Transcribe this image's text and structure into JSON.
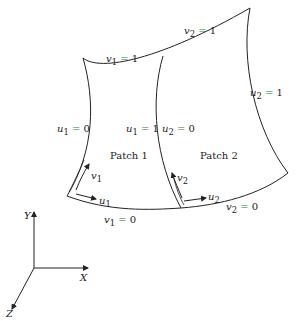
{
  "diagram": {
    "type": "two bicubic surface patches joined along a common edge",
    "patches": [
      {
        "name": "Patch 1",
        "label": "Patch 1"
      },
      {
        "name": "Patch 2",
        "label": "Patch 2"
      }
    ],
    "edge_labels": {
      "v1_top": {
        "var": "v",
        "sub": "1",
        "eq": "=",
        "val": "1"
      },
      "v2_top": {
        "var": "v",
        "sub": "2",
        "eq": "=",
        "val": "1"
      },
      "u1_left": {
        "var": "u",
        "sub": "1",
        "eq": "=",
        "val": "0"
      },
      "u1_right": {
        "var": "u",
        "sub": "1",
        "eq": "=",
        "val": "1"
      },
      "u2_left": {
        "var": "u",
        "sub": "2",
        "eq": "=",
        "val": "0"
      },
      "u2_right": {
        "var": "u",
        "sub": "2",
        "eq": "=",
        "val": "1"
      },
      "v1_bottom": {
        "var": "v",
        "sub": "1",
        "eq": "=",
        "val": "0"
      },
      "v2_bottom": {
        "var": "v",
        "sub": "2",
        "eq": "=",
        "val": "0"
      }
    },
    "direction_arrows": {
      "patch1_u": {
        "var": "u",
        "sub": "1"
      },
      "patch1_v": {
        "var": "v",
        "sub": "1"
      },
      "patch2_u": {
        "var": "u",
        "sub": "2"
      },
      "patch2_v": {
        "var": "v",
        "sub": "2"
      }
    },
    "axes": {
      "x": "X",
      "y": "Y",
      "z": "Z"
    },
    "colors": {
      "line": "#222222",
      "equals_sign": "#2e7d32",
      "background": "#ffffff"
    }
  }
}
